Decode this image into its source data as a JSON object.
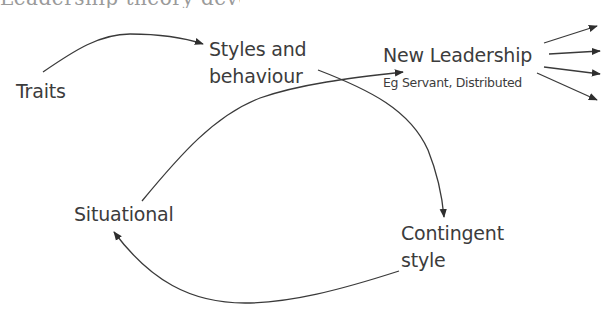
{
  "header": {
    "cutoff_text": "Leadership theory development"
  },
  "diagram": {
    "nodes": [
      {
        "id": "traits",
        "label": "Traits"
      },
      {
        "id": "styles",
        "label_line1": "Styles and",
        "label_line2": "behaviour"
      },
      {
        "id": "new_leadership",
        "label": "New Leadership",
        "sublabel": "Eg Servant, Distributed"
      },
      {
        "id": "situational",
        "label": "Situational"
      },
      {
        "id": "contingent",
        "label_line1": "Contingent",
        "label_line2": "style"
      }
    ],
    "edges": [
      {
        "from": "traits",
        "to": "styles"
      },
      {
        "from": "styles",
        "to": "contingent"
      },
      {
        "from": "contingent",
        "to": "situational"
      },
      {
        "from": "situational",
        "to": "new_leadership"
      },
      {
        "from": "new_leadership",
        "to": "outward-1"
      },
      {
        "from": "new_leadership",
        "to": "outward-2"
      },
      {
        "from": "new_leadership",
        "to": "outward-3"
      },
      {
        "from": "new_leadership",
        "to": "outward-4"
      }
    ],
    "colors": {
      "line": "#3a3a3a",
      "text": "#3c3c3c",
      "background": "#ffffff"
    }
  }
}
